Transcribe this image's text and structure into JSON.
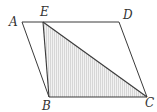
{
  "diagram": {
    "type": "geometry",
    "colors": {
      "stroke": "#3a3a3a",
      "shade": "#d8d8d8",
      "label": "#333333"
    },
    "points": {
      "A": {
        "x": 22,
        "y": 22,
        "label": "A"
      },
      "E": {
        "x": 43,
        "y": 22,
        "label": "E"
      },
      "D": {
        "x": 119,
        "y": 22,
        "label": "D"
      },
      "B": {
        "x": 49,
        "y": 97,
        "label": "B"
      },
      "C": {
        "x": 147,
        "y": 97,
        "label": "C"
      }
    },
    "segments": [
      "AD",
      "DC",
      "CB",
      "BA",
      "EB",
      "EC"
    ],
    "shaded_region": [
      "E",
      "B",
      "C"
    ]
  }
}
